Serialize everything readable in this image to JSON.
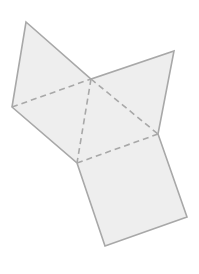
{
  "diagram": {
    "colors": {
      "background": "#ffffff",
      "fill": "#eeeeee",
      "stroke": "#a8a8a8"
    },
    "vertices": {
      "triangle_apex": [
        91,
        79
      ],
      "triangle_right": [
        158,
        134
      ],
      "triangle_bottom_left": [
        77,
        163
      ],
      "left_square_top": [
        26,
        22
      ],
      "left_square_left": [
        12,
        107
      ],
      "right_square_top": [
        174,
        51
      ],
      "bottom_square_right": [
        187,
        217
      ],
      "bottom_square_bottom": [
        105,
        246
      ]
    },
    "shapes": [
      {
        "name": "left-square",
        "points": "26,22 91,79 77,163 12,107"
      },
      {
        "name": "right-square",
        "points": "91,79 174,51 158,134"
      },
      {
        "name": "bottom-square",
        "points": "77,163 158,134 187,217 105,246"
      },
      {
        "name": "triangle",
        "points": "91,79 158,134 77,163"
      }
    ],
    "dashed_edges": [
      {
        "name": "fold-left-top",
        "x1": 12,
        "y1": 107,
        "x2": 91,
        "y2": 79
      },
      {
        "name": "fold-apex-bottom",
        "x1": 91,
        "y1": 79,
        "x2": 77,
        "y2": 163
      },
      {
        "name": "fold-apex-right",
        "x1": 91,
        "y1": 79,
        "x2": 158,
        "y2": 134
      },
      {
        "name": "fold-bottom",
        "x1": 77,
        "y1": 163,
        "x2": 158,
        "y2": 134
      }
    ]
  }
}
